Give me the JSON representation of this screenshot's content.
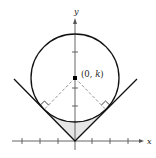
{
  "diagram": {
    "axes": {
      "x_label": "x",
      "y_label": "y",
      "x_ticks": [
        -3,
        -2,
        -1,
        1,
        2,
        3
      ],
      "y_ticks": [
        1,
        2,
        4
      ]
    },
    "center_point": {
      "label_open": "(0, ",
      "label_var": "k",
      "label_close": ")"
    },
    "colors": {
      "stroke": "#111111",
      "axis": "#555555",
      "dashed": "#888888",
      "shade": "#e6e6e6"
    }
  }
}
